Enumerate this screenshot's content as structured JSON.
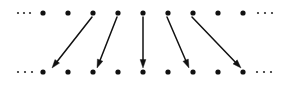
{
  "figure": {
    "width": 291,
    "height": 85,
    "background_color": "#ffffff",
    "ink_color": "#111111"
  },
  "rows": [
    {
      "name": "top-row",
      "y": 13,
      "dot_radius": 2.6,
      "leading_ellipsis": {
        "label": "...",
        "dots_x": [
          18,
          24,
          30
        ],
        "radius": 1.1
      },
      "trailing_ellipsis": {
        "label": "...",
        "dots_x": [
          258,
          265,
          272
        ],
        "radius": 1.1
      },
      "dots_x": [
        43,
        68,
        93,
        118,
        143,
        168,
        193,
        218,
        243
      ]
    },
    {
      "name": "bottom-row",
      "y": 72,
      "dot_radius": 2.6,
      "leading_ellipsis": {
        "label": "...",
        "dots_x": [
          18,
          25,
          32
        ],
        "radius": 1.1
      },
      "trailing_ellipsis": {
        "label": "...",
        "dots_x": [
          257,
          264,
          271
        ],
        "radius": 1.1
      },
      "dots_x": [
        43,
        68,
        93,
        118,
        143,
        168,
        193,
        218,
        243
      ]
    }
  ],
  "arrows": [
    {
      "name": "arrow-1",
      "from_x": 92,
      "from_y": 17,
      "to_x": 52,
      "to_y": 68,
      "direction": "down-left"
    },
    {
      "name": "arrow-2",
      "from_x": 117,
      "from_y": 17,
      "to_x": 97,
      "to_y": 68,
      "direction": "down-left"
    },
    {
      "name": "arrow-3",
      "from_x": 143,
      "from_y": 17,
      "to_x": 143,
      "to_y": 68,
      "direction": "down"
    },
    {
      "name": "arrow-4",
      "from_x": 167,
      "from_y": 17,
      "to_x": 189,
      "to_y": 68,
      "direction": "down-right"
    },
    {
      "name": "arrow-5",
      "from_x": 192,
      "from_y": 17,
      "to_x": 241,
      "to_y": 68,
      "direction": "down-right"
    }
  ]
}
